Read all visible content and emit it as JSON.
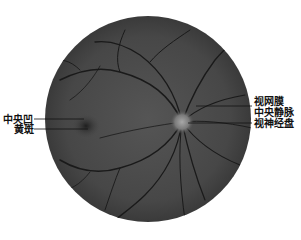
{
  "figure": {
    "labels": {
      "fovea": "中央凹",
      "macula": "黄斑",
      "central_retinal_vein_line1": "视网膜",
      "central_retinal_vein_line2": "中央静脉",
      "optic_disc": "视神经盘"
    },
    "colors": {
      "background": "#ffffff",
      "fundus": "#4a4a4a",
      "vessel": "#1a1a1a",
      "disc": "#8a8a8a"
    }
  }
}
